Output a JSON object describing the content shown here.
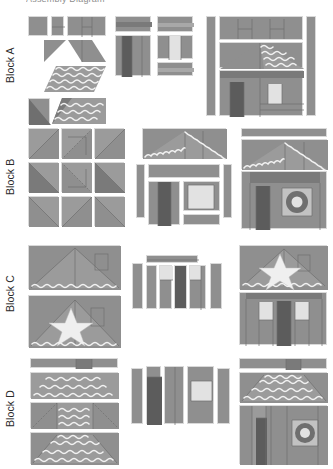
{
  "document": {
    "caption": "Assembly Diagram",
    "palette": {
      "background": "#ffffff",
      "mid_grey": "#8f8f8f",
      "dark_grey": "#5c5c5c",
      "light_grey": "#c2c2c2",
      "window_white": "#e2e2e2",
      "seam_line": "#6f6f6f",
      "chevron_highlight": "#f2f2f2",
      "label_text": "#2b2b2b"
    }
  },
  "rows": [
    {
      "label": "Block A",
      "stages": [
        {
          "name": "units",
          "description": "squares, half-square triangles and chevron-print parallelograms"
        },
        {
          "name": "subunits",
          "description": "pieced roof band, door panel, window panel"
        },
        {
          "name": "finished",
          "description": "house block with two upper windows, chevron roof, door and window"
        }
      ]
    },
    {
      "label": "Block B",
      "stages": [
        {
          "name": "units",
          "description": "nine half-square triangle squares"
        },
        {
          "name": "subunits",
          "description": "peaked chevron roof, door unit, window unit, side strips"
        },
        {
          "name": "finished",
          "description": "house block with peaked roof, door and round window"
        }
      ]
    },
    {
      "label": "Block C",
      "stages": [
        {
          "name": "units",
          "description": "plain roof triangle and star roof triangle"
        },
        {
          "name": "subunits",
          "description": "header strip and five vertical wall strips"
        },
        {
          "name": "finished",
          "description": "house block with star roof and striped wall"
        }
      ]
    },
    {
      "label": "Block D",
      "stages": [
        {
          "name": "units",
          "description": "chimney strip, chevron bands, tapered roof pieces"
        },
        {
          "name": "subunits",
          "description": "five vertical wall strips with window"
        },
        {
          "name": "finished",
          "description": "house block with chimney, chevron hipped roof and round window"
        }
      ]
    }
  ]
}
